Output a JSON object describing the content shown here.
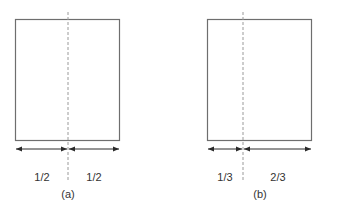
{
  "colors": {
    "stroke": "#6e6e6e",
    "dashed": "#9a9a9a",
    "arrow": "#2a2a2a",
    "text": "#333333"
  },
  "panels": [
    {
      "id": "a",
      "caption": "(a)",
      "left_label": "1/2",
      "right_label": "1/2",
      "split_fraction": 0.5
    },
    {
      "id": "b",
      "caption": "(b)",
      "left_label": "1/3",
      "right_label": "2/3",
      "split_fraction": 0.3333
    }
  ]
}
